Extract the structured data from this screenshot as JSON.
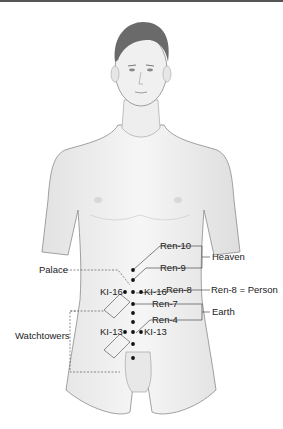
{
  "figure": {
    "points": {
      "ren10": "Ren-10",
      "ren9": "Ren-9",
      "ren8": "Ren-8",
      "ren7": "Ren-7",
      "ren4": "Ren-4",
      "ki16_left": "KI-16",
      "ki16_right": "KI-16",
      "ki13_left": "KI-13",
      "ki13_right": "KI-13"
    },
    "groups": {
      "heaven": "Heaven",
      "person": "Ren-8 = Person",
      "earth": "Earth",
      "palace": "Palace",
      "watchtowers": "Watchtowers"
    },
    "colors": {
      "skin": "#efefef",
      "outline": "#8a8a8a",
      "hair": "#6a6a6a",
      "dot": "#111111",
      "line": "#333333"
    }
  }
}
